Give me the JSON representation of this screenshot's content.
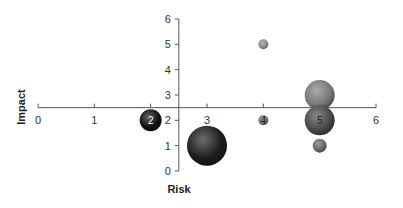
{
  "chart_data": {
    "type": "bubble",
    "title": "",
    "xlabel": "Risk",
    "ylabel": "Impact",
    "xlim": [
      0,
      6
    ],
    "ylim": [
      0,
      6
    ],
    "x_ticks": [
      "0",
      "1",
      "2",
      "3",
      "4",
      "5",
      "6"
    ],
    "y_ticks": [
      "0",
      "1",
      "2",
      "3",
      "4",
      "5",
      "6"
    ],
    "x_axis_crosses_y_at": 2.5,
    "y_axis_crosses_x_at": 2.5,
    "grid": false,
    "legend": "none",
    "points": [
      {
        "x": 2,
        "y": 2,
        "size": 11,
        "color": "#111111",
        "label": "2",
        "label_color": "#ffffff"
      },
      {
        "x": 3,
        "y": 1,
        "size": 20,
        "color": "#1e1e1e",
        "label": "",
        "label_color": ""
      },
      {
        "x": 4,
        "y": 5,
        "size": 5,
        "color": "#8a8a8a",
        "label": "",
        "label_color": ""
      },
      {
        "x": 4,
        "y": 2,
        "size": 5,
        "color": "#707070",
        "label": "4",
        "label_color": "#222222"
      },
      {
        "x": 5,
        "y": 3,
        "size": 15,
        "color": "#7a7a7a",
        "label": "",
        "label_color": ""
      },
      {
        "x": 5,
        "y": 2,
        "size": 15,
        "color": "#4a4a4a",
        "label": "5",
        "label_color": "#222222"
      },
      {
        "x": 5,
        "y": 1,
        "size": 7,
        "color": "#666666",
        "label": "",
        "label_color": ""
      }
    ]
  },
  "colors": {
    "axis": "#555555",
    "background": "#ffffff"
  }
}
